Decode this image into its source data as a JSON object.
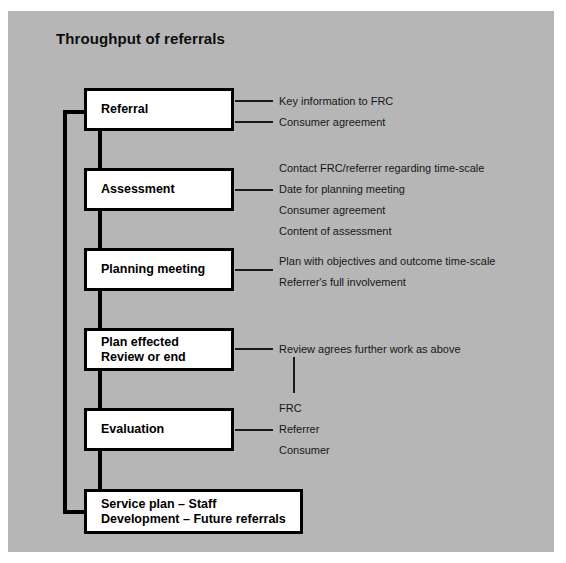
{
  "diagram": {
    "title": "Throughput of referrals",
    "background_color": "#b6b6b6",
    "box_fill": "#ffffff",
    "line_color": "#000000",
    "steps": [
      {
        "id": "referral",
        "label": "Referral",
        "annotations": [
          "Key information to FRC",
          "Consumer agreement"
        ]
      },
      {
        "id": "assessment",
        "label": "Assessment",
        "annotations": [
          "Contact FRC/referrer regarding time-scale",
          "Date for planning meeting",
          "Consumer agreement",
          "Content of assessment"
        ]
      },
      {
        "id": "planning-meeting",
        "label": "Planning meeting",
        "annotations": [
          "Plan with objectives and outcome time-scale",
          "Referrer's full involvement"
        ]
      },
      {
        "id": "plan-effected",
        "label": "Plan effected\nReview or end",
        "annotations": [
          "Review agrees further work as above"
        ]
      },
      {
        "id": "evaluation",
        "label": "Evaluation",
        "annotations": [
          "FRC",
          "Referrer",
          "Consumer"
        ]
      },
      {
        "id": "service-plan",
        "label": "Service plan – Staff\nDevelopment – Future referrals",
        "annotations": []
      }
    ]
  }
}
